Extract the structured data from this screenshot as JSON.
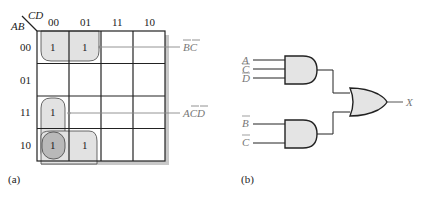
{
  "kmap": {
    "corner_row_var": "AB",
    "corner_col_var": "CD",
    "col_labels": [
      "00",
      "01",
      "11",
      "10"
    ],
    "row_labels": [
      "00",
      "01",
      "11",
      "10"
    ],
    "cells": [
      [
        "1",
        "1",
        "",
        ""
      ],
      [
        "",
        "",
        "",
        ""
      ],
      [
        "1",
        "",
        "",
        ""
      ],
      [
        "1",
        "1",
        "",
        ""
      ]
    ],
    "groups": [
      {
        "term": "B̄C̄",
        "label_text": "BC",
        "overbar": "both"
      },
      {
        "term": "AC̄D̄",
        "label_text": "ACD",
        "overbar": "CD"
      }
    ],
    "caption": "(a)"
  },
  "circuit": {
    "gate1_inputs": [
      "A",
      "C",
      "D"
    ],
    "gate1_overbars": [
      false,
      true,
      true
    ],
    "gate2_inputs": [
      "B",
      "C"
    ],
    "gate2_overbars": [
      true,
      true
    ],
    "output_label": "X",
    "caption": "(b)"
  },
  "colors": {
    "group_fill": "#e2e2e2",
    "overlap_fill": "#b9b9b9",
    "gate_fill": "#e4e4e4",
    "shadow": "#c8c8c8",
    "line": "#222222",
    "label_grey": "#777777"
  }
}
